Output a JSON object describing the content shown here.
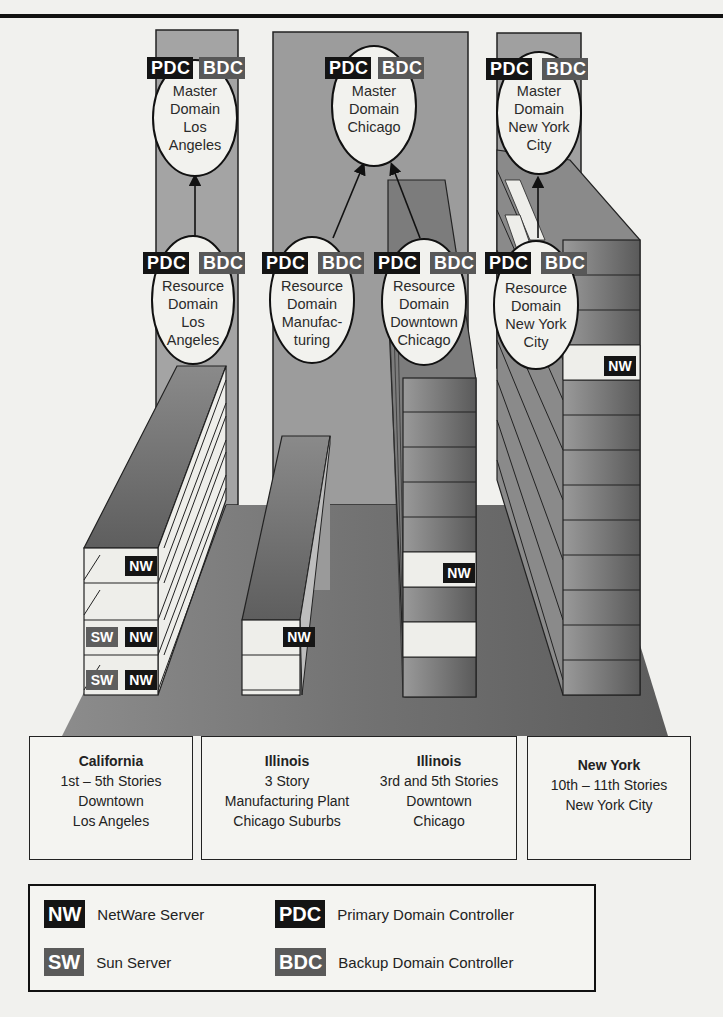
{
  "tags": {
    "pdc": "PDC",
    "bdc": "BDC",
    "nw": "NW",
    "sw": "SW"
  },
  "domains": {
    "master_la": {
      "lines": [
        "Master",
        "Domain",
        "Los",
        "Angeles"
      ]
    },
    "master_chicago": {
      "lines": [
        "Master",
        "Domain",
        "Chicago"
      ]
    },
    "master_nyc": {
      "lines": [
        "Master",
        "Domain",
        "New York",
        "City"
      ]
    },
    "resource_la": {
      "lines": [
        "Resource",
        "Domain",
        "Los",
        "Angeles"
      ]
    },
    "resource_mfg": {
      "lines": [
        "Resource",
        "Domain",
        "Manufac-",
        "turing"
      ]
    },
    "resource_chicago": {
      "lines": [
        "Resource",
        "Domain",
        "Downtown",
        "Chicago"
      ]
    },
    "resource_nyc": {
      "lines": [
        "Resource",
        "Domain",
        "New York",
        "City"
      ]
    }
  },
  "trust_links": [
    {
      "from": "resource_la",
      "to": "master_la"
    },
    {
      "from": "resource_mfg",
      "to": "master_chicago"
    },
    {
      "from": "resource_chicago",
      "to": "master_chicago"
    },
    {
      "from": "resource_nyc",
      "to": "master_nyc"
    }
  ],
  "buildings": [
    {
      "id": "la",
      "floors": 5,
      "servers": [
        [
          "NW"
        ],
        [],
        [
          "SW",
          "NW"
        ],
        [],
        [
          "SW",
          "NW"
        ]
      ]
    },
    {
      "id": "mfg",
      "floors": 3,
      "servers": [
        [
          "NW"
        ],
        [],
        []
      ]
    },
    {
      "id": "chicago",
      "floors": 11,
      "servers_floor_nw": 6
    },
    {
      "id": "nyc",
      "floors": 11,
      "servers_floor_nw": 1
    }
  ],
  "locations": {
    "california": {
      "state": "California",
      "lines": [
        "1st – 5th Stories",
        "Downtown",
        "Los Angeles"
      ]
    },
    "illinois_mfg": {
      "state": "Illinois",
      "lines": [
        "3 Story",
        "Manufacturing Plant",
        "Chicago Suburbs"
      ]
    },
    "illinois_downtown": {
      "state": "Illinois",
      "lines": [
        "3rd and 5th Stories",
        "Downtown",
        "Chicago"
      ]
    },
    "new_york": {
      "state": "New York",
      "lines": [
        "10th – 11th Stories",
        "New York City"
      ]
    }
  },
  "legend": {
    "nw": {
      "tag": "NW",
      "label": "NetWare Server"
    },
    "sw": {
      "tag": "SW",
      "label": "Sun Server"
    },
    "pdc": {
      "tag": "PDC",
      "label": "Primary Domain Controller"
    },
    "bdc": {
      "tag": "BDC",
      "label": "Backup Domain Controller"
    }
  },
  "colors": {
    "pdc": "#141414",
    "bdc": "#585858",
    "nw": "#151515",
    "sw": "#5e5e5e",
    "floor": "#7a7a7a",
    "panel": "#9a9a9a"
  }
}
